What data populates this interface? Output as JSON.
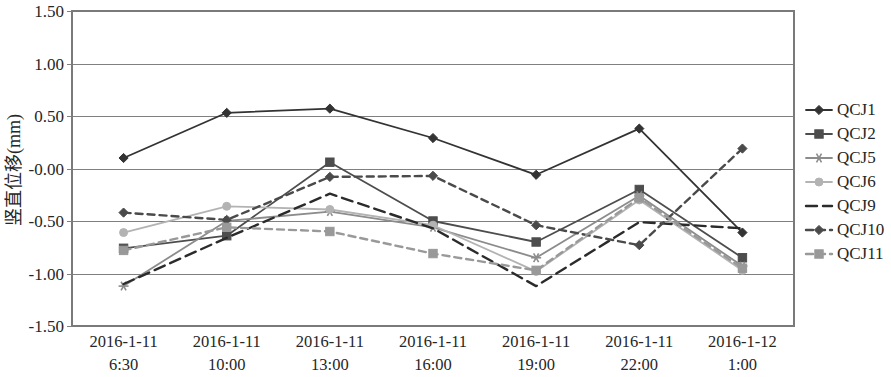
{
  "chart_data": {
    "type": "line",
    "title": "",
    "xlabel": "",
    "ylabel": "竖直位移(mm)",
    "ylim": [
      -1.5,
      1.5
    ],
    "ytick_labels": [
      "1.50",
      "1.00",
      "0.50",
      "-0.00",
      "-0.50",
      "-1.00",
      "-1.50"
    ],
    "ytick_values": [
      1.5,
      1.0,
      0.5,
      0.0,
      -0.5,
      -1.0,
      -1.5
    ],
    "grid": true,
    "legend_position": "right",
    "categories": [
      "2016-1-11\n6:30",
      "2016-1-11\n10:00",
      "2016-1-11\n13:00",
      "2016-1-11\n16:00",
      "2016-1-11\n19:00",
      "2016-1-11\n22:00",
      "2016-1-12\n1:00"
    ],
    "categories_lines": [
      [
        "2016-1-11",
        "6:30"
      ],
      [
        "2016-1-11",
        "10:00"
      ],
      [
        "2016-1-11",
        "13:00"
      ],
      [
        "2016-1-11",
        "16:00"
      ],
      [
        "2016-1-11",
        "19:00"
      ],
      [
        "2016-1-11",
        "22:00"
      ],
      [
        "2016-1-12",
        "1:00"
      ]
    ],
    "series": [
      {
        "name": "QCJ1",
        "color": "#333333",
        "dash": "none",
        "marker": "diamond",
        "values": [
          0.1,
          0.53,
          0.57,
          0.29,
          -0.06,
          0.38,
          -0.61
        ]
      },
      {
        "name": "QCJ2",
        "color": "#4d4d4d",
        "dash": "none",
        "marker": "square",
        "values": [
          -0.76,
          -0.64,
          0.06,
          -0.5,
          -0.7,
          -0.2,
          -0.85
        ]
      },
      {
        "name": "QCJ5",
        "color": "#8c8c8c",
        "dash": "none",
        "marker": "star",
        "values": [
          -1.12,
          -0.5,
          -0.41,
          -0.56,
          -0.85,
          -0.26,
          -0.93
        ]
      },
      {
        "name": "QCJ6",
        "color": "#b3b3b3",
        "dash": "none",
        "marker": "circle",
        "values": [
          -0.61,
          -0.36,
          -0.39,
          -0.54,
          -0.98,
          -0.3,
          -0.97
        ]
      },
      {
        "name": "QCJ9",
        "color": "#2b2b2b",
        "dash": "long",
        "marker": "none",
        "values": [
          -1.1,
          -0.66,
          -0.24,
          -0.57,
          -1.12,
          -0.51,
          -0.57
        ]
      },
      {
        "name": "QCJ10",
        "color": "#4a4a4a",
        "dash": "short",
        "marker": "diamond",
        "values": [
          -0.42,
          -0.49,
          -0.08,
          -0.07,
          -0.54,
          -0.73,
          0.19
        ]
      },
      {
        "name": "QCJ11",
        "color": "#999999",
        "dash": "short",
        "marker": "square",
        "values": [
          -0.78,
          -0.56,
          -0.6,
          -0.81,
          -0.97,
          -0.28,
          -0.95
        ]
      }
    ]
  },
  "legend": {
    "items": [
      "QCJ1",
      "QCJ2",
      "QCJ5",
      "QCJ6",
      "QCJ9",
      "QCJ10",
      "QCJ11"
    ]
  },
  "axis": {
    "y_title": "竖直位移(mm)"
  }
}
